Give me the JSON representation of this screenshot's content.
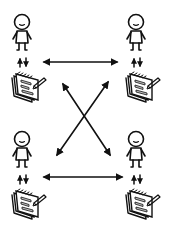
{
  "diagram": {
    "title": "",
    "colors": {
      "ink": "#111111",
      "background": "#ffffff",
      "fill": "#bdbdbd"
    },
    "nodes": [
      {
        "id": "person-top-left",
        "icon": "person-icon",
        "notepad": "notepad-icon",
        "x": 22,
        "y": 24
      },
      {
        "id": "person-top-right",
        "icon": "person-icon",
        "notepad": "notepad-icon",
        "x": 135,
        "y": 24
      },
      {
        "id": "person-bottom-left",
        "icon": "person-icon",
        "notepad": "notepad-icon",
        "x": 22,
        "y": 141
      },
      {
        "id": "person-bottom-right",
        "icon": "person-icon",
        "notepad": "notepad-icon",
        "x": 135,
        "y": 141
      }
    ],
    "edges": [
      {
        "from": "person-top-left",
        "to": "person-top-right",
        "type": "bidirectional"
      },
      {
        "from": "person-bottom-left",
        "to": "person-bottom-right",
        "type": "bidirectional"
      },
      {
        "from": "person-top-left",
        "to": "person-bottom-right",
        "type": "bidirectional"
      },
      {
        "from": "person-top-right",
        "to": "person-bottom-left",
        "type": "bidirectional"
      },
      {
        "from": "person",
        "to": "notepad",
        "type": "up-down-pair",
        "count": 4
      }
    ]
  }
}
